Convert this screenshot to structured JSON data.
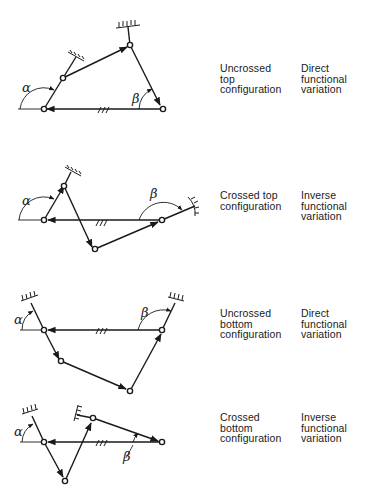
{
  "figure": {
    "rows": [
      {
        "id": "uncrossed-top",
        "configuration_lines": [
          "Uncrossed",
          "top",
          "configuration"
        ],
        "variation_lines": [
          "Direct",
          "functional",
          "variation"
        ],
        "angle_labels": {
          "alpha": "α",
          "beta": "β"
        }
      },
      {
        "id": "crossed-top",
        "configuration_lines": [
          "Crossed top",
          "configuration"
        ],
        "variation_lines": [
          "Inverse",
          "functional",
          "variation"
        ],
        "angle_labels": {
          "alpha": "α",
          "beta": "β"
        }
      },
      {
        "id": "uncrossed-bottom",
        "configuration_lines": [
          "Uncrossed",
          "bottom",
          "configuration"
        ],
        "variation_lines": [
          "Direct",
          "functional",
          "variation"
        ],
        "angle_labels": {
          "alpha": "α",
          "beta": "β"
        }
      },
      {
        "id": "crossed-bottom",
        "configuration_lines": [
          "Crossed",
          "bottom",
          "configuration"
        ],
        "variation_lines": [
          "Inverse",
          "functional",
          "variation"
        ],
        "angle_labels": {
          "alpha": "α",
          "beta": "β"
        }
      }
    ],
    "colors": {
      "ink": "#1a1a1a",
      "background": "#ffffff"
    }
  }
}
